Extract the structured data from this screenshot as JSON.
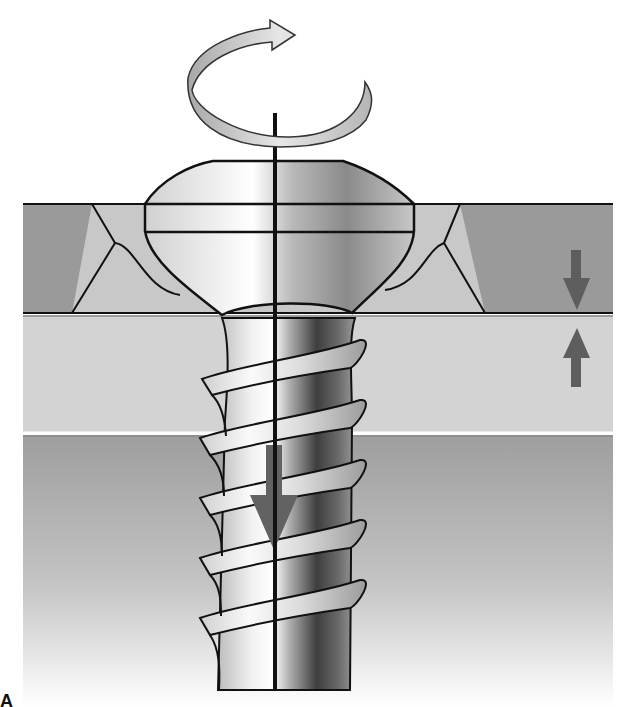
{
  "diagram": {
    "type": "lag-screw-compression-illustration",
    "corner_label": "A",
    "elements": {
      "rotation_arrow": {
        "icon": "clockwise-rotation-arrow-icon",
        "direction": "clockwise"
      },
      "screw_axis": {
        "icon": "axis-line"
      },
      "screw_head": {
        "shape": "domed-head-countersunk"
      },
      "screw_shaft": {
        "thread_turns": 6
      },
      "insertion_arrow": {
        "icon": "arrow-down-icon",
        "direction": "down"
      },
      "compression_arrows": [
        {
          "icon": "arrow-down-icon",
          "direction": "down"
        },
        {
          "icon": "arrow-up-icon",
          "direction": "up"
        }
      ],
      "layers": [
        {
          "name": "near-fragment",
          "color": "#9a9a9a"
        },
        {
          "name": "countersink-region",
          "color": "#c8c8c8"
        },
        {
          "name": "middle-layer",
          "color": "#cfcfcf"
        },
        {
          "name": "far-fragment",
          "color": "#a3a3a3"
        }
      ]
    },
    "colors": {
      "outline": "#111111",
      "arrow_dark": "#5e5e5e",
      "rotation_arrow_fill": "#c9c9c9",
      "screw_light": "#f4f4f4",
      "screw_dark": "#4a4a4a"
    }
  }
}
